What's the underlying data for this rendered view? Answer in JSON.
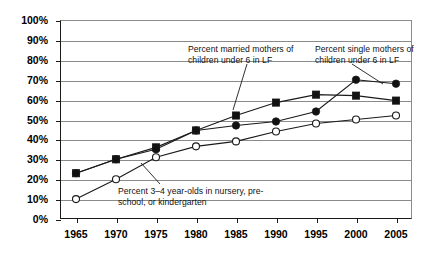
{
  "chart_data": {
    "type": "line",
    "title": "",
    "xlabel": "",
    "ylabel": "",
    "x": [
      1965,
      1970,
      1975,
      1980,
      1985,
      1990,
      1995,
      2000,
      2005
    ],
    "categories": [
      "1965",
      "1970",
      "1975",
      "1980",
      "1985",
      "1990",
      "1995",
      "2000",
      "2005"
    ],
    "ylim": [
      0,
      100
    ],
    "xlim": [
      1963,
      2007
    ],
    "grid": true,
    "legend_position": "inline-annotations",
    "ytick_labels": [
      "0%",
      "10%",
      "20%",
      "30%",
      "40%",
      "50%",
      "60%",
      "70%",
      "80%",
      "90%",
      "100%"
    ],
    "ytick_values": [
      0,
      10,
      20,
      30,
      40,
      50,
      60,
      70,
      80,
      90,
      100
    ],
    "series": [
      {
        "name": "Percent married mothers of children under 6 in LF",
        "marker": "filled-square",
        "values": [
          23,
          30,
          36,
          44.5,
          52,
          58.5,
          62.5,
          62,
          59.5
        ]
      },
      {
        "name": "Percent single mothers of children under 6 in LF",
        "marker": "filled-circle",
        "values": [
          23,
          30,
          35,
          44.5,
          47,
          49,
          54,
          70,
          68
        ]
      },
      {
        "name": "Percent 3–4 year-olds in nursery, pre-school, or kindergarten",
        "marker": "open-circle",
        "values": [
          10,
          20,
          31,
          36.5,
          39,
          44,
          48,
          50,
          52
        ]
      }
    ],
    "annotations": [
      {
        "id": "married",
        "text": "Percent married mothers of\nchildren under 6 in LF",
        "points_to_year": 1985
      },
      {
        "id": "single",
        "text": "Percent single mothers of\nchildren under 6 in LF",
        "points_to_year": 2005
      },
      {
        "id": "nursery",
        "text": "Percent 3–4 year-olds in nursery, pre-\nschool, or kindergarten",
        "points_to_year": 1975
      }
    ],
    "colors": {
      "line": "#1a1a1a",
      "grid": "#8a8a8a",
      "axis": "#1a1a1a",
      "marker_fill": "#111111",
      "open_marker_fill": "#ffffff",
      "background": "#ffffff",
      "text": "#000000"
    }
  }
}
